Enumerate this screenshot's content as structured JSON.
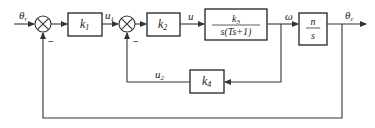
{
  "diagram": {
    "type": "control-system-block-diagram",
    "signals": {
      "input": "θr",
      "input_sub": "r",
      "u1": "u",
      "u1_sub": "1",
      "u": "u",
      "omega": "ω",
      "u2": "u",
      "u2_sub": "2",
      "output": "θ",
      "output_sub": "c"
    },
    "blocks": {
      "k1": {
        "label": "k",
        "sub": "1"
      },
      "k2": {
        "label": "k",
        "sub": "2"
      },
      "plant": {
        "numerator": "k",
        "numerator_sub": "3",
        "denominator": "s(Ts+1)"
      },
      "integrator": {
        "numerator": "n",
        "denominator": "s"
      },
      "k4": {
        "label": "k",
        "sub": "4"
      }
    },
    "summing_junctions": [
      {
        "id": "sum1",
        "feedback_sign": "−"
      },
      {
        "id": "sum2",
        "feedback_sign": "−"
      }
    ],
    "colors": {
      "line": "#333333",
      "background": "#ffffff"
    }
  }
}
